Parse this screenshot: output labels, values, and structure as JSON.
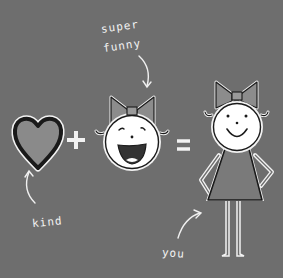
{
  "illustration": {
    "labels": {
      "top_line1": "super",
      "top_line2": "funny",
      "kind": "kind",
      "you": "you"
    },
    "operators": {
      "plus": "+",
      "equals": "="
    },
    "colors": {
      "background": "#6e6e6e",
      "heart_fill": "#8a8a8a",
      "heart_stroke": "#1a1a1a",
      "face_fill": "#ffffff",
      "bow_fill": "#8c8c8c",
      "dress_fill": "#7a7a7a",
      "line_white": "#f2f2f2",
      "outline_dark": "#1a1a1a"
    },
    "icons": [
      "heart-icon",
      "plus-sign",
      "laughing-face-icon",
      "equals-sign",
      "girl-figure-icon",
      "arrow-icon"
    ]
  }
}
